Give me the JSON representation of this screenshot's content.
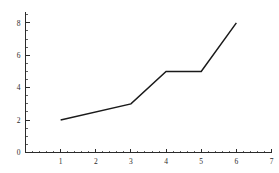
{
  "chart_data": {
    "type": "line",
    "title": "",
    "xlabel": "",
    "ylabel": "",
    "xlim": [
      0,
      7
    ],
    "ylim": [
      0,
      8.7
    ],
    "grid": false,
    "legend": null,
    "x": [
      1,
      3,
      4,
      5,
      6
    ],
    "values": [
      2,
      3,
      5,
      5,
      8
    ],
    "points": [
      {
        "x": 1,
        "y": 2
      },
      {
        "x": 3,
        "y": 3
      },
      {
        "x": 4,
        "y": 5
      },
      {
        "x": 5,
        "y": 5
      },
      {
        "x": 6,
        "y": 8
      }
    ],
    "series": [
      {
        "name": "",
        "x": [
          1,
          3,
          4,
          5,
          6
        ],
        "values": [
          2,
          3,
          5,
          5,
          8
        ]
      }
    ],
    "xticks": [
      1,
      2,
      3,
      4,
      5,
      6,
      7
    ],
    "xtick_labels": [
      "1",
      "2",
      "3",
      "4",
      "5",
      "6",
      "7"
    ],
    "x_minor_ticks": [
      0.2,
      0.4,
      0.6,
      0.8,
      1.2,
      1.4,
      1.6,
      1.8,
      2.2,
      2.4,
      2.6,
      2.8,
      3.2,
      3.4,
      3.6,
      3.8,
      4.2,
      4.4,
      4.6,
      4.8,
      5.2,
      5.4,
      5.6,
      5.8,
      6.2,
      6.4,
      6.6,
      6.8
    ],
    "yticks": [
      0,
      2,
      4,
      6,
      8
    ],
    "ytick_labels": [
      "0",
      "2",
      "4",
      "6",
      "8"
    ],
    "y_minor_ticks": [
      0.5,
      1.0,
      1.5,
      2.5,
      3.0,
      3.5,
      4.5,
      5.0,
      5.5,
      6.5,
      7.0,
      7.5,
      8.5
    ],
    "line_color": "#1a1a1a",
    "axis_color": "#2b2b2b",
    "background_color": "#ffffff"
  },
  "figure": {
    "label": "line-chart"
  }
}
